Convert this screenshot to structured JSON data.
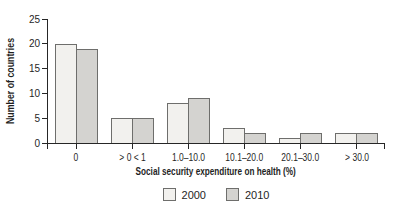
{
  "chart_data": {
    "type": "bar",
    "title": "",
    "categories": [
      "0",
      "> 0 < 1",
      "1.0–10.0",
      "10.1–20.0",
      "20.1–30.0",
      "> 30.0"
    ],
    "series": [
      {
        "name": "2000",
        "values": [
          20,
          5,
          8,
          3,
          1,
          2
        ],
        "color": "#f2f1ee"
      },
      {
        "name": "2010",
        "values": [
          19,
          5,
          9,
          2,
          2,
          2
        ],
        "color": "#d4d3d0"
      }
    ],
    "xlabel": "Social security expenditure on health (%)",
    "ylabel": "Number of countries",
    "ylim": [
      0,
      25
    ],
    "yticks": [
      0,
      5,
      10,
      15,
      20,
      25
    ],
    "grid": false,
    "legend_position": "bottom",
    "bar_border_color": "#6e6e6c",
    "axis_color": "#262626",
    "background_color": "#ffffff"
  }
}
